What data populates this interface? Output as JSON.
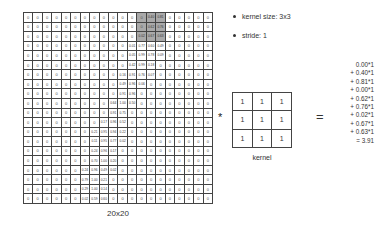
{
  "input": {
    "label": "20x20",
    "rows": 20,
    "cols": 20,
    "highlight": {
      "row": 0,
      "col": 12,
      "size": 3,
      "color": "#a9a9a9"
    },
    "nonzero": [
      {
        "r": 0,
        "c": 13,
        "v": "0.40"
      },
      {
        "r": 0,
        "c": 14,
        "v": "0.81"
      },
      {
        "r": 1,
        "c": 13,
        "v": "0.62"
      },
      {
        "r": 1,
        "c": 14,
        "v": "0.76"
      },
      {
        "r": 2,
        "c": 12,
        "v": "0.02"
      },
      {
        "r": 2,
        "c": 13,
        "v": "0.67"
      },
      {
        "r": 2,
        "c": 14,
        "v": "0.63"
      },
      {
        "r": 3,
        "c": 11,
        "v": "0.01"
      },
      {
        "r": 3,
        "c": 12,
        "v": "0.77"
      },
      {
        "r": 3,
        "c": 13,
        "v": "0.60"
      },
      {
        "r": 3,
        "c": 14,
        "v": "0.49"
      },
      {
        "r": 4,
        "c": 11,
        "v": "0.05"
      },
      {
        "r": 4,
        "c": 12,
        "v": "0.99"
      },
      {
        "r": 4,
        "c": 13,
        "v": "0.78"
      },
      {
        "r": 4,
        "c": 14,
        "v": "0.09"
      },
      {
        "r": 5,
        "c": 11,
        "v": "0.42"
      },
      {
        "r": 5,
        "c": 12,
        "v": "0.99"
      },
      {
        "r": 5,
        "c": 13,
        "v": "0.18"
      },
      {
        "r": 6,
        "c": 10,
        "v": "0.16"
      },
      {
        "r": 6,
        "c": 11,
        "v": "0.91"
      },
      {
        "r": 6,
        "c": 12,
        "v": "0.76"
      },
      {
        "r": 6,
        "c": 13,
        "v": "0.07"
      },
      {
        "r": 7,
        "c": 10,
        "v": "0.49"
      },
      {
        "r": 7,
        "c": 11,
        "v": "0.96"
      },
      {
        "r": 7,
        "c": 12,
        "v": "0.06"
      },
      {
        "r": 8,
        "c": 10,
        "v": "0.91"
      },
      {
        "r": 8,
        "c": 11,
        "v": "0.96"
      },
      {
        "r": 9,
        "c": 9,
        "v": "0.64"
      },
      {
        "r": 9,
        "c": 10,
        "v": "1.00"
      },
      {
        "r": 9,
        "c": 11,
        "v": "0.50"
      },
      {
        "r": 10,
        "c": 9,
        "v": "0.91"
      },
      {
        "r": 10,
        "c": 10,
        "v": "0.75"
      },
      {
        "r": 11,
        "c": 8,
        "v": "0.17"
      },
      {
        "r": 11,
        "c": 9,
        "v": "0.96"
      },
      {
        "r": 11,
        "c": 10,
        "v": "0.52"
      },
      {
        "r": 12,
        "c": 7,
        "v": "0.21"
      },
      {
        "r": 12,
        "c": 8,
        "v": "0.95"
      },
      {
        "r": 12,
        "c": 9,
        "v": "0.94"
      },
      {
        "r": 12,
        "c": 10,
        "v": "0.22"
      },
      {
        "r": 13,
        "c": 7,
        "v": "0.11"
      },
      {
        "r": 13,
        "c": 8,
        "v": "0.95"
      },
      {
        "r": 13,
        "c": 9,
        "v": "0.77"
      },
      {
        "r": 13,
        "c": 10,
        "v": "0.02"
      },
      {
        "r": 14,
        "c": 7,
        "v": "0.24"
      },
      {
        "r": 14,
        "c": 8,
        "v": "0.96"
      },
      {
        "r": 14,
        "c": 9,
        "v": "0.17"
      },
      {
        "r": 15,
        "c": 7,
        "v": "0.70"
      },
      {
        "r": 15,
        "c": 8,
        "v": "1.00"
      },
      {
        "r": 15,
        "c": 9,
        "v": "0.20"
      },
      {
        "r": 16,
        "c": 6,
        "v": "0.24"
      },
      {
        "r": 16,
        "c": 7,
        "v": "0.96"
      },
      {
        "r": 16,
        "c": 8,
        "v": "0.49"
      },
      {
        "r": 16,
        "c": 9,
        "v": "0.02"
      },
      {
        "r": 17,
        "c": 6,
        "v": "0.79"
      },
      {
        "r": 17,
        "c": 7,
        "v": "1.00"
      },
      {
        "r": 17,
        "c": 8,
        "v": "0.21"
      },
      {
        "r": 18,
        "c": 6,
        "v": "0.29"
      },
      {
        "r": 18,
        "c": 7,
        "v": "1.00"
      },
      {
        "r": 18,
        "c": 8,
        "v": "0.14"
      },
      {
        "r": 19,
        "c": 6,
        "v": "0.02"
      },
      {
        "r": 19,
        "c": 7,
        "v": "0.59"
      },
      {
        "r": 19,
        "c": 8,
        "v": "0.60"
      }
    ],
    "zero_value": "0"
  },
  "params": {
    "items": [
      "kernel size: 3x3",
      "stride: 1"
    ]
  },
  "operators": {
    "convolve": "*",
    "equals": "="
  },
  "kernel": {
    "label": "kernel",
    "values": [
      [
        "1",
        "1",
        "1"
      ],
      [
        "1",
        "1",
        "1"
      ],
      [
        "1",
        "1",
        "1"
      ]
    ]
  },
  "equation": {
    "lines": [
      "0.00*1",
      "+ 0.40*1",
      "+ 0.81*1",
      "+ 0.00*1",
      "+ 0.62*1",
      "+ 0.76*1",
      "+ 0.02*1",
      "+ 0.67*1",
      "+ 0.63*1",
      "= 3.91"
    ]
  }
}
